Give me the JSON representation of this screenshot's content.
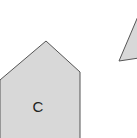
{
  "diagram": {
    "shapes": [
      {
        "id": "C",
        "type": "pentagon",
        "label": "C",
        "fill": "#d8d8d8",
        "stroke": "#555555",
        "points": "0,80 46,41 80,72 80,140 0,140"
      },
      {
        "id": "triangle-partial",
        "type": "triangle",
        "label": "",
        "fill": "#d8d8d8",
        "stroke": "#555555",
        "points": "119,61 139,14 139,58"
      }
    ]
  }
}
